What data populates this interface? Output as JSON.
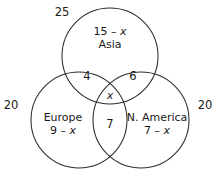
{
  "figure": {
    "type": "venn-diagram-3-set",
    "background_color": "#ffffff",
    "stroke_color": "#2b2b2b"
  },
  "sets": {
    "asia": {
      "name": "Asia",
      "expression": "15 – x",
      "outer_total": "25"
    },
    "europe": {
      "name": "Europe",
      "expression": "9 – x",
      "outer_total": "20"
    },
    "north_america": {
      "name": "N. America",
      "expression": "7 – x",
      "outer_total": "20"
    }
  },
  "regions": {
    "asia_europe": "4",
    "asia_north_america": "6",
    "all_three": "x",
    "europe_north_america": "7"
  }
}
